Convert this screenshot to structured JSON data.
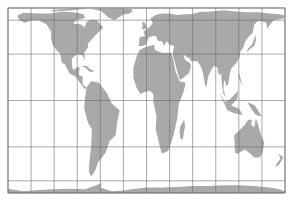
{
  "map": {
    "projection": "equal-area cylindrical (Gall-Peters style)",
    "graticule_spacing_degrees": 30,
    "meridians": [
      -180,
      -150,
      -120,
      -90,
      -60,
      -30,
      0,
      30,
      60,
      90,
      120,
      150,
      180
    ],
    "parallels": [
      -90,
      -60,
      -30,
      0,
      30,
      60,
      90
    ],
    "colors": {
      "land": "#a9a9a9",
      "ocean": "#ffffff",
      "grid": "#6e6e6e",
      "frame": "#6e6e6e"
    },
    "features": [
      {
        "name": "north-america"
      },
      {
        "name": "greenland"
      },
      {
        "name": "south-america"
      },
      {
        "name": "europe-asia"
      },
      {
        "name": "africa"
      },
      {
        "name": "arabia"
      },
      {
        "name": "india"
      },
      {
        "name": "southeast-asia"
      },
      {
        "name": "japan"
      },
      {
        "name": "indonesia"
      },
      {
        "name": "australia"
      },
      {
        "name": "new-zealand"
      },
      {
        "name": "madagascar"
      },
      {
        "name": "uk"
      },
      {
        "name": "antarctica"
      },
      {
        "name": "arctic-islands"
      },
      {
        "name": "caribbean"
      }
    ]
  }
}
